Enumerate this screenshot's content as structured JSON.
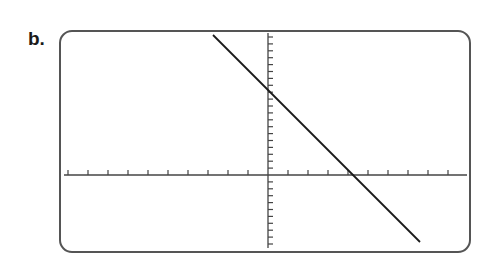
{
  "problem": {
    "label": "b."
  },
  "colors": {
    "frame": "#555555",
    "axes": "#444444",
    "line": "#1a1a1a",
    "background": "#ffffff"
  },
  "chart_data": {
    "type": "line",
    "title": "",
    "xlabel": "",
    "ylabel": "",
    "grid": false,
    "legend": null,
    "tick_labels": false,
    "xlim": [
      -10,
      10
    ],
    "ylim": [
      -10,
      20
    ],
    "x_tick_step": 1,
    "y_tick_step": 1,
    "series": [
      {
        "name": "line",
        "equation": "y = -3x + 12",
        "slope": -3,
        "y_intercept": 12,
        "x_intercept": 4,
        "x": [
          -2.75,
          7.6
        ],
        "y": [
          20.25,
          -10.8
        ]
      }
    ]
  }
}
